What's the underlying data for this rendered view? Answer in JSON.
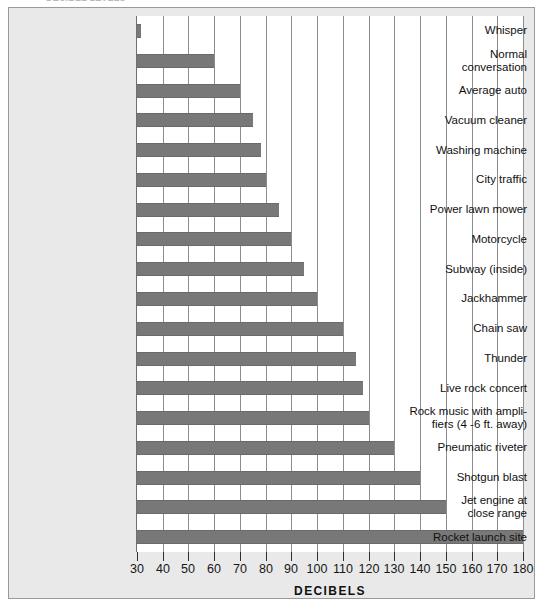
{
  "figure": {
    "top_strip_ghost_text": "DECIBEL LEVELS",
    "background_color": "#e9e9e9",
    "bar_color": "#787878",
    "grid_color": "#8d8d8d",
    "border_color": "#9a9a9a"
  },
  "chart_data": {
    "type": "bar",
    "orientation": "horizontal",
    "title": "",
    "xlabel": "DECIBELS",
    "ylabel": "",
    "xlim": [
      30,
      180
    ],
    "xticks": [
      30,
      40,
      50,
      60,
      70,
      80,
      90,
      100,
      110,
      120,
      130,
      140,
      150,
      160,
      170,
      180
    ],
    "xtick_labels": [
      "30",
      "40",
      "50",
      "60",
      "70",
      "80",
      "90",
      "100",
      "110",
      "120",
      "130",
      "140",
      "150",
      "160",
      "170",
      "180"
    ],
    "grid": true,
    "grid_axis": "x",
    "legend": false,
    "baseline": 30,
    "categories": [
      "Whisper",
      "Normal\nconversation",
      "Average auto",
      "Vacuum cleaner",
      "Washing machine",
      "City traffic",
      "Power lawn mower",
      "Motorcycle",
      "Subway (inside)",
      "Jackhammer",
      "Chain saw",
      "Thunder",
      "Live rock concert",
      "Rock music with ampli-\nfiers (4 -6 ft. away)",
      "Pneumatic riveter",
      "Shotgun blast",
      "Jet engine at\nclose range",
      "Rocket launch site"
    ],
    "values": [
      30,
      60,
      70,
      75,
      78,
      80,
      85,
      90,
      95,
      100,
      110,
      115,
      118,
      120,
      130,
      140,
      150,
      180
    ],
    "bars": [
      {
        "label": "Whisper",
        "value": 30
      },
      {
        "label": "Normal conversation",
        "value": 60
      },
      {
        "label": "Average auto",
        "value": 70
      },
      {
        "label": "Vacuum cleaner",
        "value": 75
      },
      {
        "label": "Washing machine",
        "value": 78
      },
      {
        "label": "City traffic",
        "value": 80
      },
      {
        "label": "Power lawn mower",
        "value": 85
      },
      {
        "label": "Motorcycle",
        "value": 90
      },
      {
        "label": "Subway (inside)",
        "value": 95
      },
      {
        "label": "Jackhammer",
        "value": 100
      },
      {
        "label": "Chain saw",
        "value": 110
      },
      {
        "label": "Thunder",
        "value": 115
      },
      {
        "label": "Live rock concert",
        "value": 118
      },
      {
        "label": "Rock music with amplifiers (4 -6 ft. away)",
        "value": 120
      },
      {
        "label": "Pneumatic riveter",
        "value": 130
      },
      {
        "label": "Shotgun blast",
        "value": 140
      },
      {
        "label": "Jet engine at close range",
        "value": 150
      },
      {
        "label": "Rocket launch site",
        "value": 180
      }
    ]
  }
}
